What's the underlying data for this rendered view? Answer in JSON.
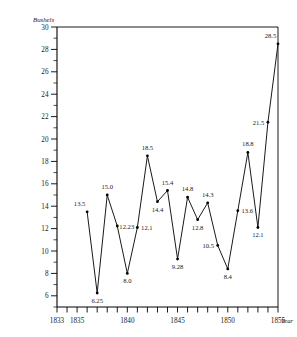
{
  "chart_data": {
    "type": "line",
    "title": "",
    "xlabel": "Year",
    "ylabel": "Bushels",
    "xlim": [
      1833,
      1855
    ],
    "ylim": [
      5,
      30
    ],
    "grid": false,
    "legend": null,
    "x_ticks": [
      1833,
      1835,
      1840,
      1845,
      1850,
      1855
    ],
    "x_tick_labels": [
      "1833",
      "1835",
      "1840",
      "1845",
      "1850",
      "1855"
    ],
    "x_minor_tick_step": 1,
    "y_ticks": [
      6,
      8,
      10,
      12,
      14,
      16,
      18,
      20,
      22,
      24,
      26,
      28,
      30
    ],
    "y_tick_labels": [
      "6",
      "8",
      "10",
      "12",
      "14",
      "16",
      "18",
      "20",
      "22",
      "24",
      "26",
      "28",
      "30"
    ],
    "y_minor_tick_step": 1,
    "x": [
      1836,
      1837,
      1838,
      1839,
      1840,
      1841,
      1842,
      1843,
      1844,
      1845,
      1846,
      1847,
      1848,
      1849,
      1850,
      1851,
      1852,
      1853,
      1854,
      1855
    ],
    "values": [
      13.5,
      6.25,
      15.0,
      12.23,
      8.0,
      12.1,
      18.5,
      14.4,
      15.4,
      9.28,
      14.8,
      12.8,
      14.3,
      10.5,
      8.4,
      13.6,
      18.8,
      12.1,
      21.5,
      28.5
    ],
    "point_labels": [
      {
        "value": "13.5",
        "x": 1836,
        "y": 13.5,
        "pos": "above-left"
      },
      {
        "value": "6.25",
        "x": 1837,
        "y": 6.25,
        "pos": "below"
      },
      {
        "value": "15.0",
        "x": 1838,
        "y": 15.0,
        "pos": "above"
      },
      {
        "value": "12.23",
        "x": 1839,
        "y": 12.23,
        "pos": "right"
      },
      {
        "value": "8.0",
        "x": 1840,
        "y": 8.0,
        "pos": "below"
      },
      {
        "value": "12.1",
        "x": 1841,
        "y": 12.1,
        "pos": "right"
      },
      {
        "value": "18.5",
        "x": 1842,
        "y": 18.5,
        "pos": "above"
      },
      {
        "value": "14.4",
        "x": 1843,
        "y": 14.4,
        "pos": "below"
      },
      {
        "value": "15.4",
        "x": 1844,
        "y": 15.4,
        "pos": "above"
      },
      {
        "value": "9.28",
        "x": 1845,
        "y": 9.28,
        "pos": "below"
      },
      {
        "value": "14.8",
        "x": 1846,
        "y": 14.8,
        "pos": "above"
      },
      {
        "value": "12.8",
        "x": 1847,
        "y": 12.8,
        "pos": "below"
      },
      {
        "value": "14.3",
        "x": 1848,
        "y": 14.3,
        "pos": "above"
      },
      {
        "value": "10.5",
        "x": 1849,
        "y": 10.5,
        "pos": "left"
      },
      {
        "value": "8.4",
        "x": 1850,
        "y": 8.4,
        "pos": "below"
      },
      {
        "value": "13.6",
        "x": 1851,
        "y": 13.6,
        "pos": "right"
      },
      {
        "value": "18.8",
        "x": 1852,
        "y": 18.8,
        "pos": "above"
      },
      {
        "value": "12.1",
        "x": 1853,
        "y": 12.1,
        "pos": "below"
      },
      {
        "value": "21.5",
        "x": 1854,
        "y": 21.5,
        "pos": "left"
      },
      {
        "value": "28.5",
        "x": 1855,
        "y": 28.5,
        "pos": "above-left"
      }
    ]
  }
}
